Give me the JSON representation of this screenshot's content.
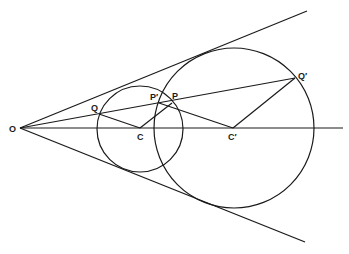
{
  "diagram": {
    "points": {
      "O": {
        "label": "O",
        "x": 20,
        "y": 128
      },
      "C": {
        "label": "C",
        "x": 140,
        "y": 128
      },
      "C_prime": {
        "label": "C′",
        "x": 233,
        "y": 128
      },
      "Q": {
        "label": "Q",
        "x": 99,
        "y": 114
      },
      "Q_prime": {
        "label": "Q′",
        "x": 295,
        "y": 78
      },
      "P": {
        "label": "P",
        "x": 172,
        "y": 103
      },
      "P_prime": {
        "label": "P′",
        "x": 159,
        "y": 103
      }
    },
    "circles": [
      {
        "name": "small-circle",
        "center": "C",
        "r": 43
      },
      {
        "name": "large-circle",
        "center": "C_prime",
        "r": 81
      }
    ],
    "lines": [
      {
        "name": "upper-tangent",
        "from": "O",
        "to": [
          307,
          11
        ]
      },
      {
        "name": "lower-tangent",
        "from": "O",
        "to": [
          305,
          242
        ]
      },
      {
        "name": "axis",
        "from": "O",
        "to": [
          343,
          128
        ]
      },
      {
        "name": "ray-O-Qprime",
        "from": "O",
        "to": "Q_prime"
      },
      {
        "name": "segment-Q-C",
        "from": "Q",
        "to": "C"
      },
      {
        "name": "segment-C-P",
        "from": "C",
        "to": "P"
      },
      {
        "name": "segment-Pprime-Cprime",
        "from": "P_prime",
        "to": "C_prime"
      },
      {
        "name": "segment-Cprime-Qprime",
        "from": "C_prime",
        "to": "Q_prime"
      }
    ]
  }
}
